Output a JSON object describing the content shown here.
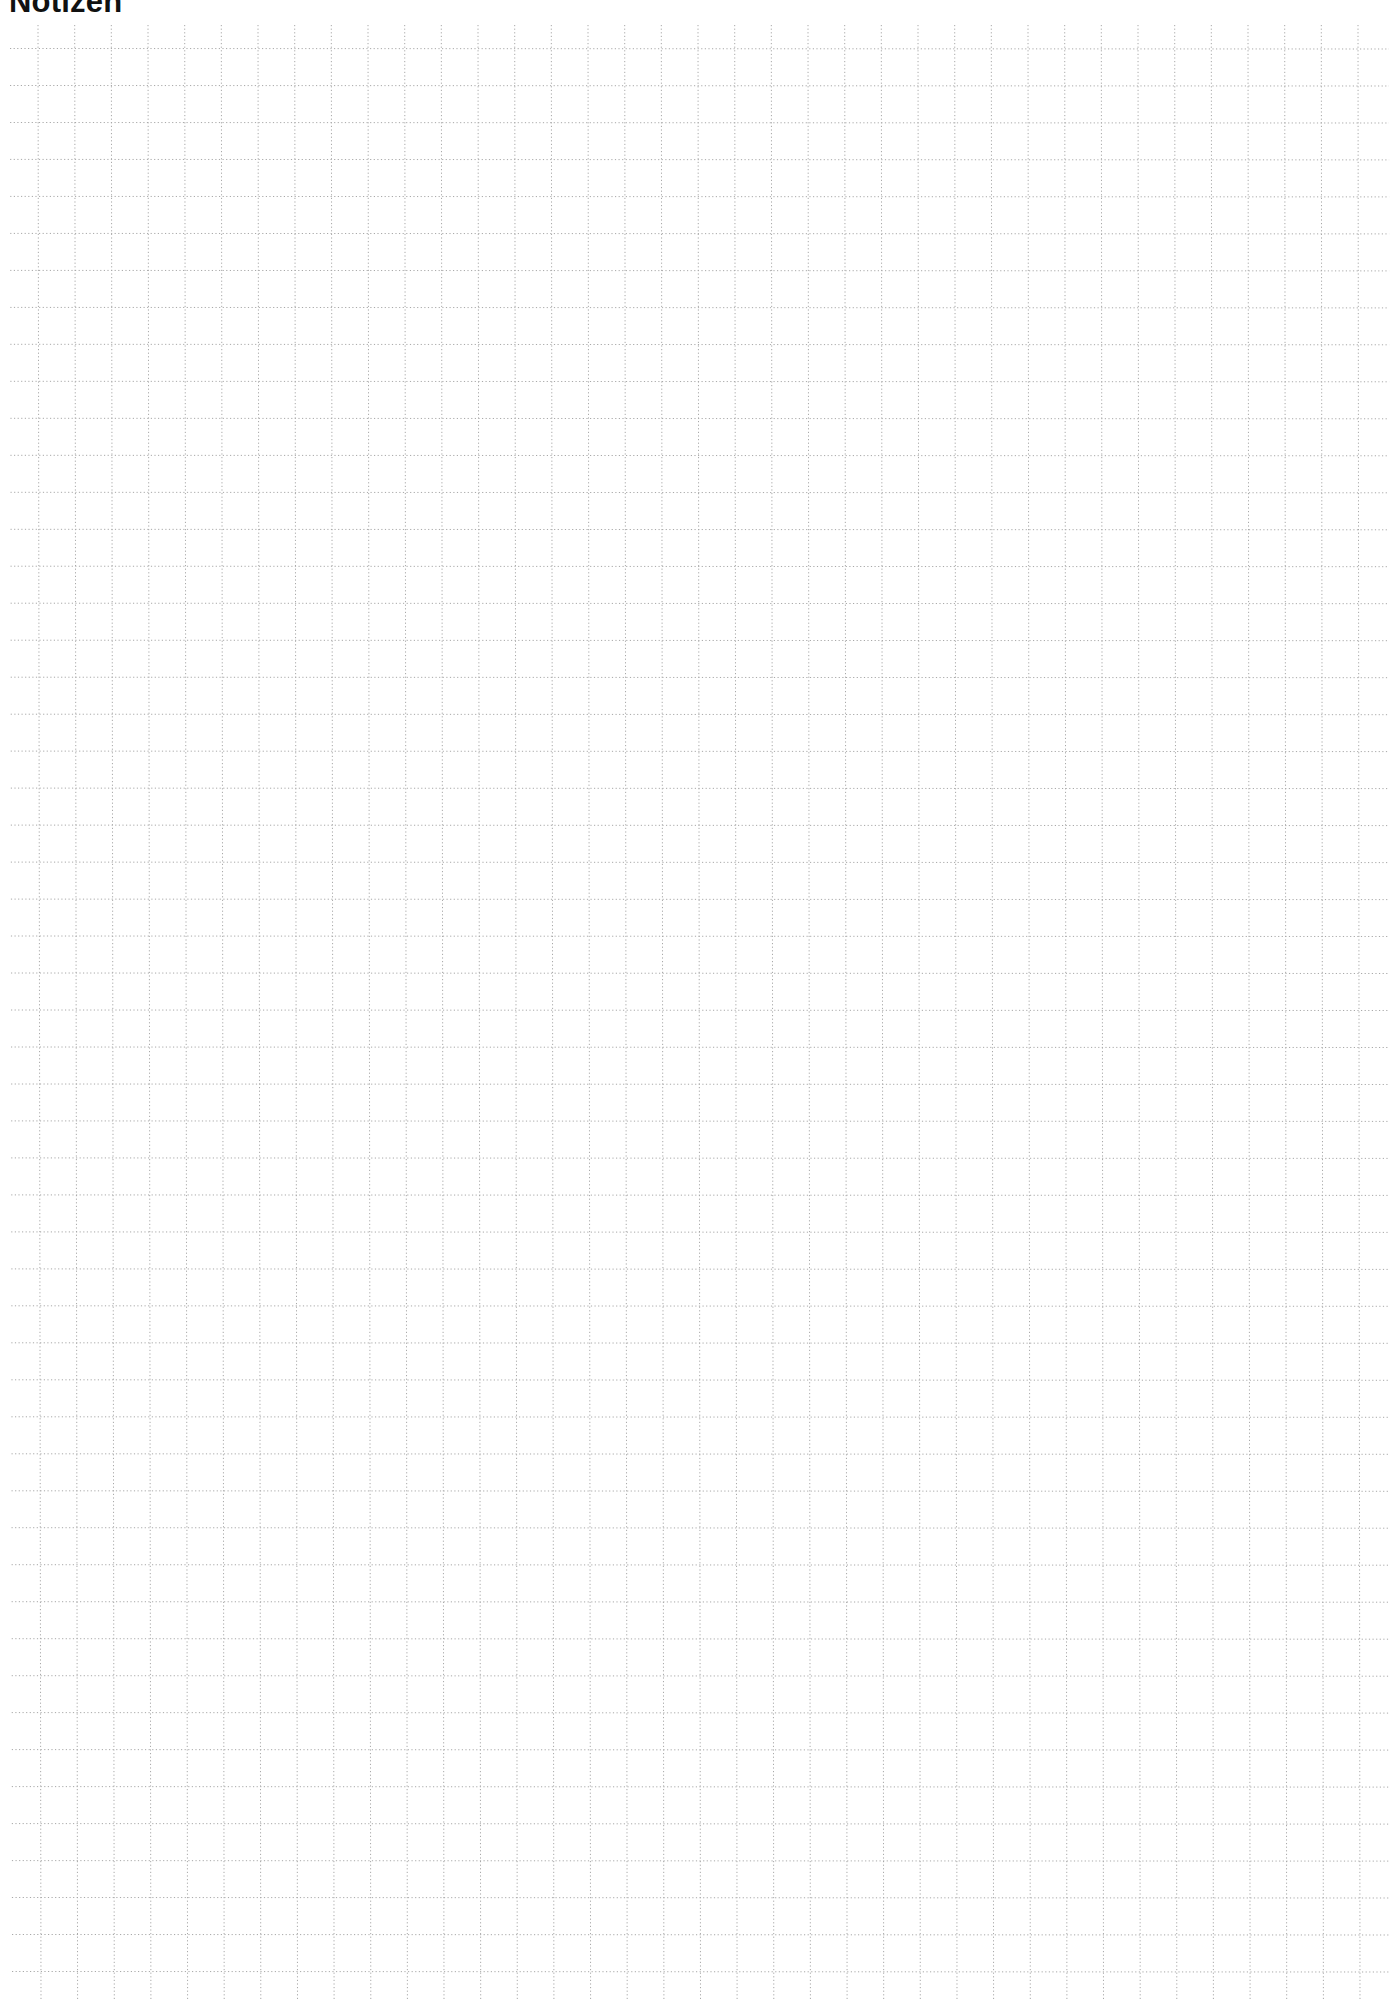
{
  "page": {
    "title": "Notizen"
  },
  "grid": {
    "type": "dotted-square-grid",
    "cell_size_px": 36.9,
    "vertical_line_count": 37,
    "horizontal_line_count": 53,
    "line_color": "#a8a8a8",
    "background_color": "#ffffff"
  }
}
